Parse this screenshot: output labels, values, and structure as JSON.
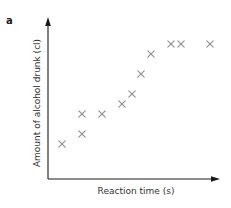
{
  "panel_label": "a",
  "colors": {
    "axis": "#1a1a1a",
    "marker": "#8e8e8e",
    "text": "#333333"
  },
  "chart_data": {
    "type": "scatter",
    "title": "",
    "panel": "a",
    "xlabel": "Reaction time (s)",
    "ylabel": "Amount of alcohol drunk (cl)",
    "marker": "x",
    "grid": false,
    "legend": null,
    "ticks": "none",
    "xlim": [
      0,
      17
    ],
    "ylim": [
      0,
      16
    ],
    "points": [
      {
        "x": 1.4,
        "y": 3.5
      },
      {
        "x": 3.4,
        "y": 4.5
      },
      {
        "x": 3.4,
        "y": 6.5
      },
      {
        "x": 5.4,
        "y": 6.5
      },
      {
        "x": 7.4,
        "y": 7.5
      },
      {
        "x": 8.4,
        "y": 8.5
      },
      {
        "x": 9.3,
        "y": 10.5
      },
      {
        "x": 10.3,
        "y": 12.5
      },
      {
        "x": 12.3,
        "y": 13.5
      },
      {
        "x": 13.3,
        "y": 13.5
      },
      {
        "x": 16.2,
        "y": 13.5
      }
    ]
  }
}
